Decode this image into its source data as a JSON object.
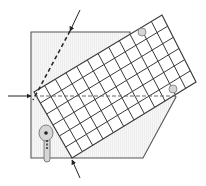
{
  "diagram": {
    "colors": {
      "background": "#ffffff",
      "line": "#555555",
      "grid": "#3a3a3a",
      "plate_fill": "#f4f4f4",
      "marker_fill": "#d6d6d6",
      "dark": "#222222"
    },
    "plate": {
      "points": [
        [
          31,
          32
        ],
        [
          130,
          32
        ],
        [
          130,
          33
        ],
        [
          176,
          97
        ],
        [
          143,
          158
        ],
        [
          31,
          158
        ]
      ]
    },
    "grid": {
      "corners": {
        "left": [
          34,
          92
        ],
        "top": [
          162,
          15
        ],
        "right": [
          196,
          82
        ],
        "bottom": [
          72,
          158
        ]
      },
      "cells_long": 12,
      "cells_short": 6
    },
    "beams": {
      "incident_horizontal": {
        "from": [
          8,
          96
        ],
        "to": [
          31,
          96
        ],
        "dashed_to": [
          176,
          96
        ]
      },
      "diagonal": {
        "from": [
          80,
          10
        ],
        "to": [
          70,
          31
        ],
        "dashed_to": [
          33,
          100
        ]
      },
      "bottom": {
        "from": [
          80,
          178
        ],
        "to": [
          72,
          160
        ]
      }
    },
    "markers": [
      {
        "name": "marker-top",
        "cx": 142,
        "cy": 32,
        "r": 4
      },
      {
        "name": "marker-right",
        "cx": 173,
        "cy": 89,
        "r": 4
      }
    ],
    "holder": {
      "circle": {
        "cx": 46,
        "cy": 133,
        "r": 7
      },
      "stem": {
        "x": 44,
        "y": 138,
        "w": 6,
        "h": 24
      }
    }
  }
}
